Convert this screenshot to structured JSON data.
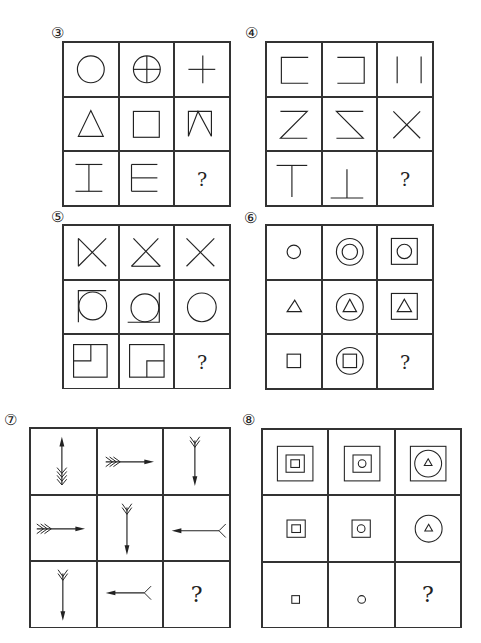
{
  "puzzles": [
    {
      "id": "p3",
      "label": "③",
      "question": "?",
      "cells": [
        "circle",
        "circle-with-cross",
        "plus",
        "triangle",
        "square",
        "open-square-with-v",
        "i-shape",
        "e-shape",
        "?"
      ]
    },
    {
      "id": "p4",
      "label": "④",
      "question": "?",
      "cells": [
        "bracket-left",
        "bracket-right",
        "two-vertical-lines",
        "z-shape",
        "reversed-z-shape",
        "x-shape",
        "t-shape",
        "inverted-t-shape",
        "?"
      ]
    },
    {
      "id": "p5",
      "label": "⑤",
      "question": "?",
      "cells": [
        "x-closed-left",
        "x-closed-bottom",
        "x-shape",
        "circle-with-top-left-corner",
        "circle-with-bottom-corners",
        "circle",
        "square-with-inner-top-left",
        "square-with-inner-bottom-right",
        "?"
      ]
    },
    {
      "id": "p6",
      "label": "⑥",
      "question": "?",
      "cells": [
        "small-circle",
        "circle-in-circle",
        "circle-in-square",
        "small-triangle",
        "triangle-in-circle",
        "triangle-in-square",
        "small-square",
        "square-in-circle",
        "?"
      ]
    },
    {
      "id": "p7",
      "label": "⑦",
      "question": "?",
      "cells": [
        "arrow-up-4-feathers",
        "arrow-right-3-feathers",
        "arrow-down-2-feathers",
        "arrow-right-3-feathers",
        "arrow-down-2-feathers",
        "arrow-left-1-feather",
        "arrow-down-2-feathers",
        "arrow-left-1-feather",
        "?"
      ]
    },
    {
      "id": "p8",
      "label": "⑧",
      "question": "?",
      "cells": [
        "square-in-square-in-square",
        "circle-in-square-in-square",
        "triangle-in-circle-in-square",
        "square-in-square",
        "circle-in-square",
        "triangle-in-circle",
        "small-square",
        "small-circle",
        "?"
      ]
    }
  ]
}
